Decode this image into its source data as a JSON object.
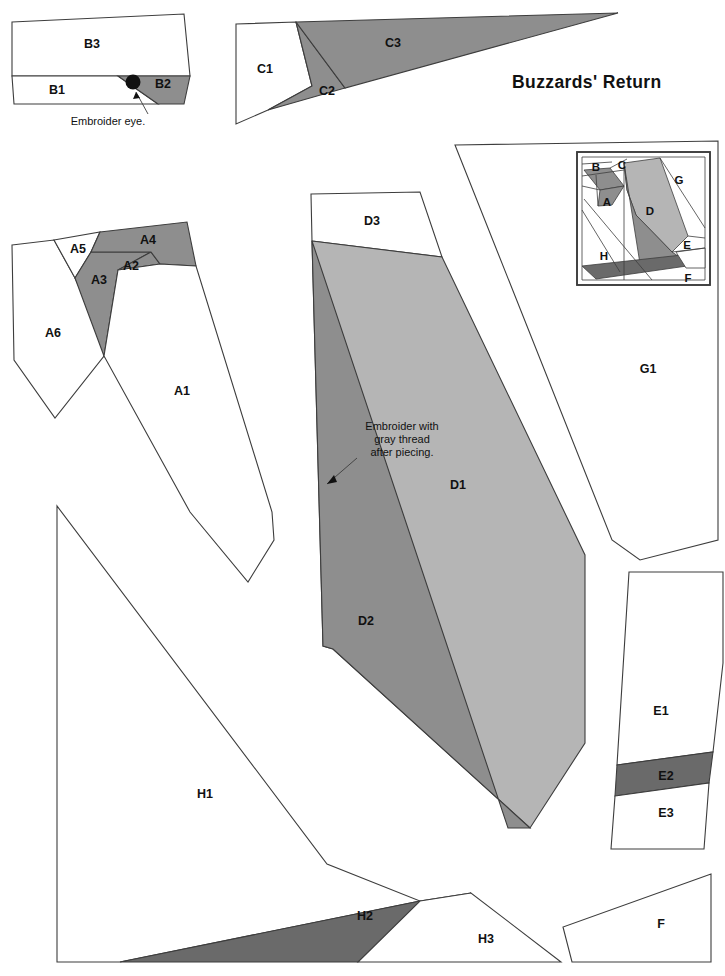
{
  "document": {
    "title": "Buzzards' Return",
    "title_position": {
      "x": 512,
      "y": 84
    },
    "type": "foundation-paper-piecing-pattern",
    "width": 725,
    "height": 976
  },
  "colors": {
    "background": "#ffffff",
    "outline": "#3d3d3d",
    "fabric_white": "#ffffff",
    "fabric_light_gray": "#b5b5b5",
    "fabric_medium_gray": "#8e8e8e",
    "fabric_dark_gray": "#6a6a6a",
    "text": "#111111"
  },
  "annotations": [
    {
      "id": "embroider-eye",
      "text": "Embroider eye.",
      "text_x": 108,
      "text_y": 122,
      "leader": "M 148,114 L 136,92",
      "arrow": "M 136,92 L 133,99 L 140,98 Z",
      "dot": {
        "cx": 133,
        "cy": 82,
        "r": 7.5
      }
    },
    {
      "id": "embroider-gray-thread",
      "lines": [
        "Embroider with",
        "gray thread",
        "after piecing."
      ],
      "text_x": 402,
      "text_y": 427,
      "line_height": 13,
      "leader": "M 357,458 L 327,484",
      "arrow": "M 327,484 L 337,482 L 334,475 Z"
    }
  ],
  "sections": [
    {
      "id": "B",
      "name": "section-b",
      "label_group": "B",
      "pieces": [
        {
          "label": "B3",
          "shade": "white",
          "label_x": 92,
          "label_y": 45,
          "points": "12,22 184,14 190,76 40,76 12,76"
        },
        {
          "label": "B1",
          "shade": "white",
          "label_x": 57,
          "label_y": 91,
          "points": "12,76 118,76 158,104 14,104"
        },
        {
          "label": "B2",
          "shade": "medium",
          "label_x": 163,
          "label_y": 85,
          "points": "118,76 190,76 184,104 158,104"
        }
      ]
    },
    {
      "id": "C",
      "name": "section-c",
      "label_group": "C",
      "pieces": [
        {
          "label": "C1",
          "shade": "white",
          "label_x": 265,
          "label_y": 70,
          "points": "236,24 296,22 312,86 268,110 236,124"
        },
        {
          "label": "C2",
          "shade": "medium",
          "label_x": 327,
          "label_y": 92,
          "points": "296,22 345,88 268,110 312,86"
        },
        {
          "label": "C3",
          "shade": "medium",
          "label_x": 393,
          "label_y": 44,
          "points": "296,22 618,13 345,88"
        }
      ]
    },
    {
      "id": "A",
      "name": "section-a",
      "label_group": "A",
      "pieces": [
        {
          "label": "A6",
          "shade": "white",
          "label_x": 53,
          "label_y": 334,
          "points": "12,245 54,240 75,278 103,340 104,356 55,418 14,360"
        },
        {
          "label": "A5",
          "shade": "white",
          "label_x": 78,
          "label_y": 250,
          "points": "54,240 100,232 91,252 75,278"
        },
        {
          "label": "A3",
          "shade": "medium",
          "label_x": 99,
          "label_y": 281,
          "points": "91,252 151,252 118,270 104,356 75,278"
        },
        {
          "label": "A2",
          "shade": "medium",
          "label_x": 131,
          "label_y": 267,
          "points": "118,270 151,252 160,264 118,270"
        },
        {
          "label": "A4",
          "shade": "medium",
          "label_x": 148,
          "label_y": 241,
          "points": "100,232 187,222 196,266 160,264 151,252 91,252"
        },
        {
          "label": "A1",
          "shade": "white",
          "label_x": 182,
          "label_y": 392,
          "points": "118,270 160,264 196,266 272,512 274,540 248,582 190,512 104,356"
        }
      ]
    },
    {
      "id": "D",
      "name": "section-d",
      "label_group": "D",
      "pieces": [
        {
          "label": "D3",
          "shade": "white",
          "label_x": 372,
          "label_y": 222,
          "points": "311,194 420,192 442,257 312,241"
        },
        {
          "label": "D1",
          "shade": "light",
          "label_x": 458,
          "label_y": 486,
          "points": "312,241 442,257 585,555 585,743 530,828 333,649 323,646"
        },
        {
          "label": "D2",
          "shade": "medium",
          "label_x": 366,
          "label_y": 622,
          "points": "312,241 323,646 333,649 530,828 508,828"
        }
      ]
    },
    {
      "id": "G",
      "name": "section-g",
      "label_group": "G",
      "pieces": [
        {
          "label": "G1",
          "shade": "white",
          "label_x": 648,
          "label_y": 370,
          "points": "455,145 718,141 718,540 640,560 612,540"
        }
      ]
    },
    {
      "id": "E",
      "name": "section-e",
      "label_group": "E",
      "pieces": [
        {
          "label": "E1",
          "shade": "white",
          "label_x": 661,
          "label_y": 712,
          "points": "629,572 723,572 723,663 713,752 617,765 629,572"
        },
        {
          "label": "E2",
          "shade": "dark",
          "label_x": 666,
          "label_y": 777,
          "points": "617,765 713,752 709,783 615,796"
        },
        {
          "label": "E3",
          "shade": "white",
          "label_x": 666,
          "label_y": 814,
          "points": "615,796 709,783 704,849 611,849"
        }
      ]
    },
    {
      "id": "F",
      "name": "section-f",
      "label_group": "F",
      "pieces": [
        {
          "label": "F",
          "shade": "white",
          "label_x": 661,
          "label_y": 925,
          "points": "711,874 711,962 572,962 563,927"
        }
      ]
    },
    {
      "id": "H",
      "name": "section-h",
      "label_group": "H",
      "pieces": [
        {
          "label": "H1",
          "shade": "white",
          "label_x": 205,
          "label_y": 795,
          "points": "57,506 57,962 120,962 420,901 327,864"
        },
        {
          "label": "H2",
          "shade": "dark",
          "label_x": 365,
          "label_y": 917,
          "points": "120,962 420,901 471,893 358,962"
        },
        {
          "label": "H3",
          "shade": "white",
          "label_x": 486,
          "label_y": 940,
          "points": "420,901 471,893 561,962 358,962"
        }
      ]
    }
  ],
  "inset": {
    "name": "assembled-block-diagram",
    "frame": {
      "x": 577,
      "y": 152,
      "width": 133,
      "height": 133
    },
    "labels": [
      {
        "text": "B",
        "x": 596,
        "y": 168
      },
      {
        "text": "C",
        "x": 622,
        "y": 166
      },
      {
        "text": "G",
        "x": 679,
        "y": 181
      },
      {
        "text": "A",
        "x": 607,
        "y": 203
      },
      {
        "text": "D",
        "x": 650,
        "y": 212
      },
      {
        "text": "E",
        "x": 687,
        "y": 246
      },
      {
        "text": "H",
        "x": 604,
        "y": 257
      },
      {
        "text": "F",
        "x": 688,
        "y": 279
      }
    ],
    "pieces": [
      {
        "shade": "white",
        "points": "582,157 705,157 705,280 582,280"
      },
      {
        "shade": "medium",
        "points": "584,170 610,168 624,186 600,190"
      },
      {
        "shade": "medium",
        "points": "600,190 624,186 612,205 598,206"
      },
      {
        "shade": "light",
        "points": "624,163 660,158 688,236 672,252 636,215 627,190"
      },
      {
        "shade": "medium",
        "points": "624,163 627,190 636,215 672,252 690,264 641,270"
      },
      {
        "shade": "dark",
        "points": "582,266 700,253 701,264 596,279"
      },
      {
        "shade": "white",
        "points": "676,252 705,248 705,268 686,268"
      }
    ],
    "lines": [
      "M 582,176 L 624,170",
      "M 582,164 L 612,162",
      "M 610,168 L 627,159",
      "M 584,199 L 652,280",
      "M 624,163 L 624,280",
      "M 660,158 L 705,228",
      "M 688,236 L 705,238",
      "M 672,252 L 705,248",
      "M 582,186 L 600,190",
      "M 596,175 L 598,206",
      "M 582,210 L 620,272"
    ]
  }
}
